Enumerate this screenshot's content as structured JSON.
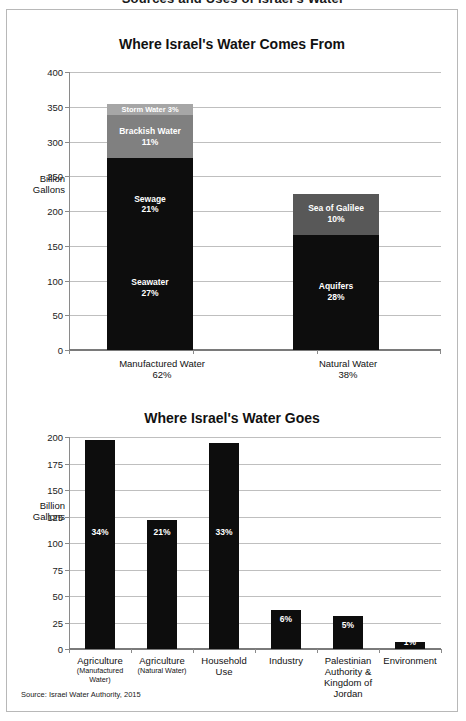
{
  "top_title": "Sources and Uses of Israel's Water",
  "source_note": "Source: Israel Water Authority, 2015",
  "chart_data": [
    {
      "type": "bar",
      "stacked": true,
      "title": "Where Israel's Water Comes From",
      "xlabel": "",
      "ylabel": "Billion Gallons",
      "ylabel_line1": "Billion",
      "ylabel_line2": "Gallons",
      "ylim": [
        0,
        400
      ],
      "yticks": [
        0,
        50,
        100,
        150,
        200,
        250,
        300,
        350,
        400
      ],
      "ytick_labels": [
        "0",
        "50",
        "100",
        "150",
        "200",
        "250",
        "300",
        "350",
        "400"
      ],
      "grid": true,
      "legend": "none",
      "categories": [
        "Manufactured Water",
        "Natural Water"
      ],
      "category_sublabels": [
        "62%",
        "38%"
      ],
      "series": [
        {
          "name": "Manufactured Water",
          "segments": [
            {
              "name": "Seawater",
              "label": "Seawater",
              "pct": "27%",
              "value": 276,
              "start": 0,
              "end": 276,
              "color": "#0d0d0d"
            },
            {
              "name": "Sewage",
              "label": "Sewage",
              "pct": "21%",
              "value": 0,
              "start": 0,
              "end": 0,
              "color": "#0d0d0d"
            },
            {
              "name": "Brackish Water",
              "label": "Brackish Water",
              "pct": "11%",
              "value": 62,
              "start": 276,
              "end": 338,
              "color": "#808080"
            },
            {
              "name": "Storm Water",
              "label": "Storm Water 3%",
              "pct": "3%",
              "value": 16,
              "start": 338,
              "end": 354,
              "color": "#a6a6a6"
            }
          ],
          "total": 354
        },
        {
          "name": "Natural Water",
          "segments": [
            {
              "name": "Aquifers",
              "label": "Aquifers",
              "pct": "28%",
              "value": 166,
              "start": 0,
              "end": 166,
              "color": "#0d0d0d"
            },
            {
              "name": "Sea of Galilee",
              "label": "Sea of Galilee",
              "pct": "10%",
              "value": 58,
              "start": 166,
              "end": 224,
              "color": "#585858"
            }
          ],
          "total": 224
        }
      ],
      "inner_labels": {
        "sewage_label": "Sewage",
        "sewage_pct": "21%",
        "seawater_label": "Seawater",
        "seawater_pct": "27%",
        "brackish_label": "Brackish Water",
        "brackish_pct": "11%",
        "storm_label": "Storm Water 3%",
        "aquifers_label": "Aquifers",
        "aquifers_pct": "28%",
        "galilee_label": "Sea of Galilee",
        "galilee_pct": "10%"
      }
    },
    {
      "type": "bar",
      "stacked": false,
      "title": "Where Israel's Water Goes",
      "xlabel": "",
      "ylabel": "Billion Gallons",
      "ylabel_line1": "Billion",
      "ylabel_line2": "Gallons",
      "ylim": [
        0,
        200
      ],
      "yticks": [
        0,
        25,
        50,
        75,
        100,
        125,
        150,
        175,
        200
      ],
      "ytick_labels": [
        "0",
        "25",
        "50",
        "75",
        "100",
        "125",
        "150",
        "175",
        "200"
      ],
      "grid": true,
      "legend": "none",
      "categories": [
        "Agriculture",
        "Agriculture",
        "Household",
        "Industry",
        "Palestinian",
        "Environment"
      ],
      "category_lines": [
        [
          "Agriculture",
          "(Manufactured Water)"
        ],
        [
          "Agriculture",
          "(Natural Water)"
        ],
        [
          "Household",
          "Use"
        ],
        [
          "Industry",
          ""
        ],
        [
          "Palestinian",
          "Authority &",
          "Kingdom of",
          "Jordan"
        ],
        [
          "Environment",
          ""
        ]
      ],
      "values": [
        197,
        122,
        194,
        37,
        31,
        7
      ],
      "data_labels": [
        "34%",
        "21%",
        "33%",
        "6%",
        "5%",
        "1%"
      ],
      "bar_color": "#0d0d0d"
    }
  ]
}
